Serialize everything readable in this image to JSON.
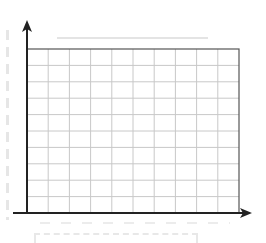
{
  "chart_data": {
    "type": "line",
    "title": "",
    "subtitle": "",
    "xlabel": "",
    "ylabel": "",
    "categories": [],
    "series": [],
    "x_grid_divisions": 10,
    "y_grid_divisions": 10,
    "grid": true,
    "legend": "none"
  },
  "colors": {
    "axis": "#222222",
    "grid": "#c8c8c8",
    "frame": "#555555",
    "placeholder": "#e6e6e6",
    "background": "#ffffff"
  },
  "layout": {
    "plot_left": 27,
    "plot_right": 239,
    "plot_top": 49,
    "plot_bottom": 213,
    "x_axis_start": 13,
    "x_axis_end": 252,
    "y_axis_top": 20
  }
}
